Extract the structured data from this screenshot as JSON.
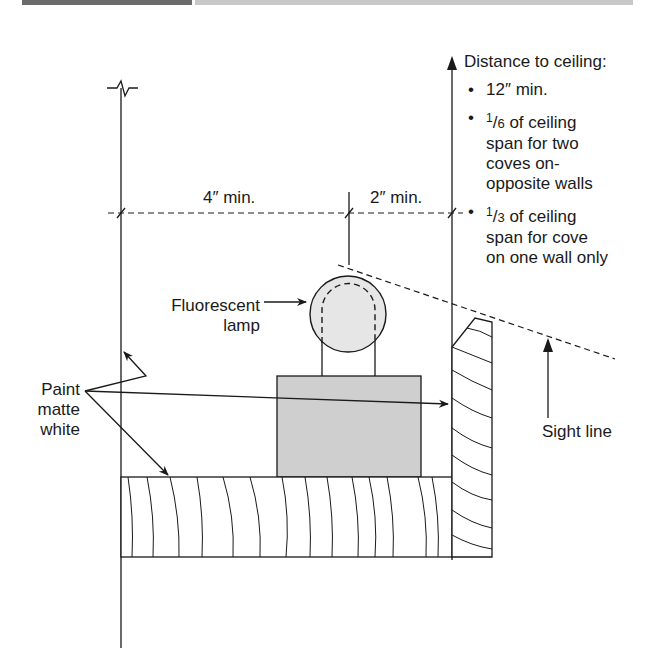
{
  "figure": {
    "header_bar": {
      "left_color": "#6b6b6b",
      "right_color": "#c8c8c8"
    }
  },
  "labels": {
    "dimension_left": "4″ min.",
    "dimension_right": "2″ min.",
    "lamp_line1": "Fluorescent",
    "lamp_line2": "lamp",
    "paint_line1": "Paint",
    "paint_line2": "matte",
    "paint_line3": "white",
    "sight_line": "Sight line"
  },
  "notes": {
    "heading": "Distance to ceiling:",
    "items": [
      {
        "text": "12″ min."
      },
      {
        "num": "1",
        "den": "6",
        "text": " of ceiling span for two coves on-opposite walls",
        "line1": " of ceiling",
        "line2": "span for two",
        "line3": "coves on-",
        "line4": "opposite walls"
      },
      {
        "num": "1",
        "den": "3",
        "text": " of ceiling span for cove on one wall only",
        "line1": " of ceiling",
        "line2": "span for cove",
        "line3": "on one wall only"
      }
    ]
  },
  "colors": {
    "line": "#1a1a1a",
    "ballast_fill": "#cfcfcf",
    "lamp_fill": "#e6e6e6",
    "background": "#ffffff"
  }
}
